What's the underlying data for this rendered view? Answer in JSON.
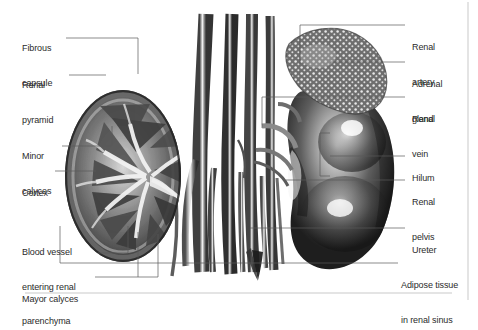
{
  "figure": {
    "type": "anatomical-illustration",
    "style": "grayscale halftone engraving",
    "background_color": "#ffffff",
    "text_color": "#2b2b2b",
    "leader_color": "#5a5a5a",
    "rule_color": "#c9c9c9",
    "structures": [
      "left kidney coronal section",
      "abdominal aorta",
      "inferior vena cava",
      "right kidney external view",
      "adrenal gland",
      "ureters"
    ]
  },
  "labels_left": [
    {
      "id": "fibrous-capsule",
      "line1": "Fibrous",
      "line2": "capsule"
    },
    {
      "id": "renal-pyramid",
      "line1": "Renal",
      "line2": "pyramid"
    },
    {
      "id": "minor-calyces",
      "line1": "Minor",
      "line2": "calyces"
    },
    {
      "id": "cortex",
      "line1": "Cortex",
      "line2": ""
    },
    {
      "id": "blood-vessel",
      "line1": "Blood vessel",
      "line2": "entering renal",
      "line3": "parenchyma"
    },
    {
      "id": "mayor-calyces",
      "line1": "Mayor calyces",
      "line2": ""
    }
  ],
  "labels_right": [
    {
      "id": "renal-artery",
      "line1": "Renal",
      "line2": "artery"
    },
    {
      "id": "adrenal-gland",
      "line1": "Adrenal",
      "line2": "gland"
    },
    {
      "id": "renal-vein",
      "line1": "Renal",
      "line2": "vein"
    },
    {
      "id": "hilum",
      "line1": "Hilum",
      "line2": ""
    },
    {
      "id": "renal-pelvis",
      "line1": "Renal",
      "line2": "pelvis"
    },
    {
      "id": "ureter",
      "line1": "Ureter",
      "line2": ""
    },
    {
      "id": "adipose-tissue",
      "line1": "Adipose tissue",
      "line2": "in renal sinus"
    }
  ]
}
